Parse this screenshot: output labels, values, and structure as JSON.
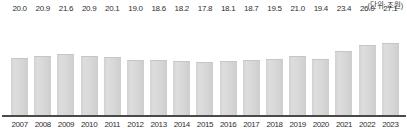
{
  "chart_data": {
    "type": "bar",
    "title": "",
    "subtitle": "",
    "unit_note": "(단위: 조원)",
    "xlabel": "",
    "ylabel": "",
    "grid": false,
    "legend": null,
    "axis_baseline_visible": true,
    "value_labels_visible": true,
    "ylim": [
      0,
      29
    ],
    "categories": [
      "2007",
      "2008",
      "2009",
      "2010",
      "2011",
      "2012",
      "2013",
      "2014",
      "2015",
      "2016",
      "2017",
      "2018",
      "2019",
      "2020",
      "2021",
      "2022",
      "2023"
    ],
    "values": [
      20.0,
      20.9,
      21.6,
      20.9,
      20.1,
      19.0,
      18.6,
      18.2,
      17.8,
      18.1,
      18.7,
      19.5,
      21.0,
      19.4,
      23.4,
      26.0,
      27.1
    ],
    "value_labels": [
      "20.0",
      "20.9",
      "21.6",
      "20.9",
      "20.1",
      "19.0",
      "18.6",
      "18.2",
      "17.8",
      "18.1",
      "18.7",
      "19.5",
      "21.0",
      "19.4",
      "23.4",
      "26.0",
      "27.1"
    ],
    "colors": {
      "bar_fill": "#d8d8d8",
      "bar_edge": "#c6c6c6",
      "axis_line": "#4a4a4a",
      "value_text": "#2f2f2f",
      "tick_text": "#2f2f2f",
      "unit_text": "#3a3a3a",
      "background": "#ffffff"
    }
  }
}
